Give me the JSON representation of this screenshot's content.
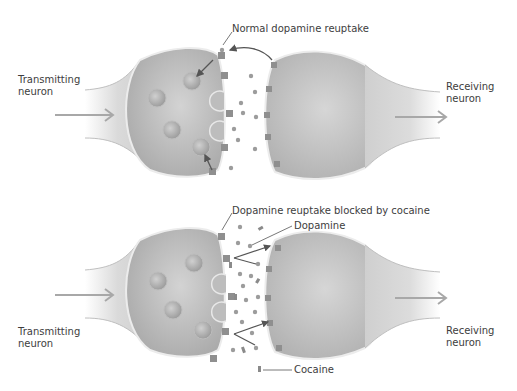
{
  "figure": {
    "panels": [
      {
        "id": "normal",
        "annotation": "Normal dopamine reuptake",
        "left_label": [
          "Transmitting",
          "neuron"
        ],
        "right_label": [
          "Receiving",
          "neuron"
        ]
      },
      {
        "id": "cocaine",
        "annotation": "Dopamine reuptake blocked by cocaine",
        "dopamine_label": "Dopamine",
        "cocaine_label": "Cocaine",
        "left_label": [
          "Transmitting",
          "neuron"
        ],
        "right_label": [
          "Receiving",
          "neuron"
        ]
      }
    ],
    "colors": {
      "neuron_fill": "#c9c9c9",
      "neuron_dark": "#a9a9a9",
      "membrane": "#e6e6e6",
      "axon_fill": "#d6d6d6",
      "vesicle": "#b5b5b5",
      "dopamine": "#9c9c9c",
      "transporter": "#8f8f8f",
      "arrow": "#555555",
      "flow_arrow": "#a8a8a8"
    }
  }
}
